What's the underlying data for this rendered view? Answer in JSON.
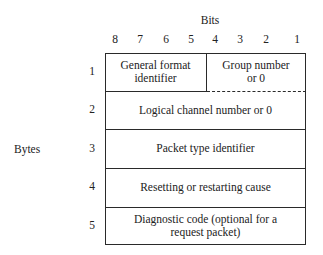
{
  "diagram": {
    "bits_title": "Bits",
    "bit_numbers": [
      "8",
      "7",
      "6",
      "5",
      "4",
      "3",
      "2",
      "1"
    ],
    "bytes_label": "Bytes",
    "byte_numbers": [
      "1",
      "2",
      "3",
      "4",
      "5"
    ],
    "fields": {
      "general_format_identifier": [
        "General format",
        "identifier"
      ],
      "group_number": [
        "Group number",
        "or 0"
      ],
      "logical_channel": "Logical channel number or 0",
      "packet_type": "Packet type identifier",
      "cause": "Resetting or restarting cause",
      "diagnostic": [
        "Diagnostic code (optional for a",
        "request packet)"
      ]
    },
    "colors": {
      "line": "#2a2a2a",
      "text": "#222222",
      "background": "#ffffff"
    }
  }
}
